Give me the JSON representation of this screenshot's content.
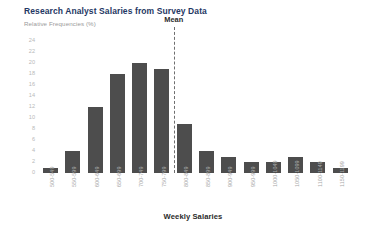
{
  "chart_data": {
    "type": "bar",
    "title": "Research Analyst Salaries from Survey Data",
    "ylabel": "Relative Frequencies (%)",
    "xlabel": "Weekly Salaries",
    "ylim": [
      0,
      24
    ],
    "ytick_step": 2,
    "yticks": [
      "24",
      "22",
      "20",
      "18",
      "16",
      "14",
      "12",
      "10",
      "8",
      "6",
      "4",
      "2",
      "0"
    ],
    "grid": false,
    "legend": "none",
    "bar_color": "#4d4d4d",
    "title_color": "#1f3864",
    "categories": [
      "500-549",
      "550-599",
      "600-649",
      "650-699",
      "700-749",
      "750-799",
      "800-849",
      "850-899",
      "900-949",
      "950-999",
      "1000-1049",
      "1050-1099",
      "1100-1149",
      "1150-1199"
    ],
    "values": [
      1,
      4,
      12,
      18,
      20,
      19,
      9,
      4,
      3,
      2,
      2,
      3,
      2,
      1
    ],
    "annotations": [
      {
        "label": "Mean",
        "type": "vertical-dashed-line",
        "between": [
          "750-799",
          "800-849"
        ],
        "color": "#6f6f6f"
      }
    ]
  }
}
